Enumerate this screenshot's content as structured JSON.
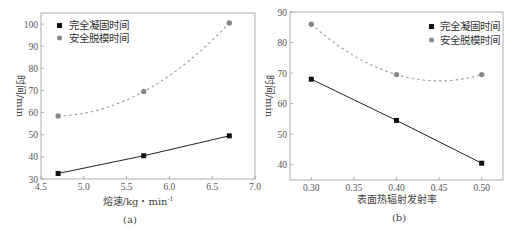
{
  "chart_data": [
    {
      "type": "line",
      "panel": "(a)",
      "xlabel": "熔速/kg・min⁻¹",
      "ylabel": "时间/min",
      "xlim": [
        4.5,
        7.0
      ],
      "ylim": [
        30,
        105
      ],
      "xticks": [
        "4.5",
        "5.0",
        "5.5",
        "6.0",
        "6.5",
        "7.0"
      ],
      "yticks": [
        "30",
        "40",
        "50",
        "60",
        "70",
        "80",
        "90",
        "100"
      ],
      "x": [
        4.7,
        5.7,
        6.7
      ],
      "series": [
        {
          "name": "完全凝固时间",
          "marker": "square",
          "line": "solid",
          "color": "#111111",
          "values": [
            32.5,
            40.5,
            49.5
          ]
        },
        {
          "name": "安全脱模时间",
          "marker": "circle",
          "line": "dashed-fit",
          "color": "#888888",
          "values": [
            58.5,
            69.5,
            100.5
          ]
        }
      ],
      "legend_position": "upper left",
      "grid": false
    },
    {
      "type": "line",
      "panel": "(b)",
      "xlabel": "表面热辐射发射率",
      "ylabel": "时间/min",
      "xlim": [
        0.275,
        0.525
      ],
      "ylim": [
        35,
        90
      ],
      "xticks": [
        "0.30",
        "0.35",
        "0.40",
        "0.45",
        "0.50"
      ],
      "yticks": [
        "40",
        "50",
        "60",
        "70",
        "80",
        "90"
      ],
      "x": [
        0.3,
        0.4,
        0.5
      ],
      "series": [
        {
          "name": "完全凝固时间",
          "marker": "square",
          "line": "solid",
          "color": "#111111",
          "values": [
            68,
            54.5,
            40.5
          ]
        },
        {
          "name": "安全脱模时间",
          "marker": "circle",
          "line": "dashed-fit",
          "color": "#888888",
          "values": [
            86,
            69.5,
            69.5
          ]
        }
      ],
      "legend_position": "upper right",
      "grid": false
    }
  ],
  "labels": {
    "a_xlabel": "熔速/kg・min",
    "a_xlabel_sup": "-1",
    "a_ylabel": "时间/min",
    "a_caption": "(a)",
    "b_xlabel": "表面热辐射发射率",
    "b_ylabel": "时间/min",
    "b_caption": "(b)",
    "legend_s1": "完全凝固时间",
    "legend_s2": "安全脱模时间"
  }
}
